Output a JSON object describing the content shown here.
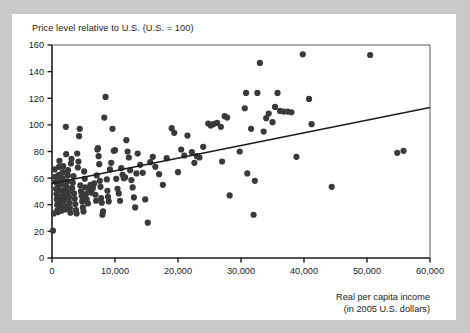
{
  "page": {
    "background_color": "#c9c9c9",
    "card_color": "#ffffff",
    "top_fragment": ""
  },
  "chart_data": {
    "type": "scatter",
    "title": "Price level relative to U.S. (U.S. = 100)",
    "xlabel_line1": "Real per capita income",
    "xlabel_line2": "(in 2005 U.S. dollars)",
    "ylabel": "Price level relative to U.S. (U.S. = 100)",
    "xlim": [
      0,
      60000
    ],
    "ylim": [
      0,
      160
    ],
    "xticks": [
      0,
      10000,
      20000,
      30000,
      40000,
      50000,
      60000
    ],
    "xtick_labels": [
      "0",
      "10,000",
      "20,000",
      "30,000",
      "40,000",
      "50,000",
      "60,000"
    ],
    "yticks": [
      0,
      20,
      40,
      60,
      80,
      100,
      120,
      140,
      160
    ],
    "ytick_labels": [
      "0",
      "20",
      "40",
      "60",
      "80",
      "100",
      "120",
      "140",
      "160"
    ],
    "grid": false,
    "legend": null,
    "marker_color": "#3a3a3a",
    "marker_size": 3.1,
    "trendline": {
      "type": "line",
      "color": "#1b1b1b",
      "x": [
        0,
        60000
      ],
      "y": [
        56,
        113
      ]
    },
    "points": [
      [
        150,
        20.5
      ],
      [
        300,
        33.5
      ],
      [
        420,
        66.5
      ],
      [
        520,
        61.0
      ],
      [
        600,
        57.0
      ],
      [
        650,
        52.0
      ],
      [
        700,
        48.0
      ],
      [
        760,
        44.0
      ],
      [
        820,
        40.0
      ],
      [
        880,
        36.0
      ],
      [
        930,
        34.5
      ],
      [
        980,
        54.0
      ],
      [
        1020,
        58.5
      ],
      [
        1080,
        62.5
      ],
      [
        1120,
        68.5
      ],
      [
        1180,
        73.0
      ],
      [
        1250,
        50.5
      ],
      [
        1300,
        46.0
      ],
      [
        1360,
        42.0
      ],
      [
        1420,
        38.5
      ],
      [
        1500,
        35.5
      ],
      [
        1560,
        55.5
      ],
      [
        1620,
        60.0
      ],
      [
        1700,
        64.5
      ],
      [
        1780,
        69.0
      ],
      [
        1850,
        51.0
      ],
      [
        1900,
        47.0
      ],
      [
        1980,
        43.5
      ],
      [
        2050,
        39.0
      ],
      [
        2120,
        36.5
      ],
      [
        2200,
        98.5
      ],
      [
        2250,
        78.0
      ],
      [
        2320,
        53.5
      ],
      [
        2400,
        57.5
      ],
      [
        2480,
        62.0
      ],
      [
        2550,
        66.0
      ],
      [
        2620,
        49.5
      ],
      [
        2700,
        45.5
      ],
      [
        2780,
        41.5
      ],
      [
        2850,
        37.5
      ],
      [
        2920,
        34.0
      ],
      [
        3000,
        71.0
      ],
      [
        3100,
        74.5
      ],
      [
        3200,
        52.5
      ],
      [
        3300,
        56.5
      ],
      [
        3400,
        61.5
      ],
      [
        3500,
        48.5
      ],
      [
        3600,
        44.5
      ],
      [
        3700,
        40.5
      ],
      [
        3800,
        36.0
      ],
      [
        3900,
        33.5
      ],
      [
        4000,
        78.5
      ],
      [
        4100,
        68.0
      ],
      [
        4200,
        72.5
      ],
      [
        4300,
        91.5
      ],
      [
        4400,
        97.0
      ],
      [
        4500,
        54.5
      ],
      [
        4600,
        50.0
      ],
      [
        4700,
        46.5
      ],
      [
        4800,
        42.5
      ],
      [
        4900,
        38.0
      ],
      [
        5000,
        35.0
      ],
      [
        5100,
        65.0
      ],
      [
        5200,
        59.5
      ],
      [
        5300,
        53.0
      ],
      [
        5400,
        48.0
      ],
      [
        5500,
        44.0
      ],
      [
        5700,
        41.0
      ],
      [
        5900,
        51.5
      ],
      [
        6100,
        55.0
      ],
      [
        6300,
        49.0
      ],
      [
        6500,
        52.5
      ],
      [
        6700,
        56.0
      ],
      [
        6900,
        47.5
      ],
      [
        7000,
        43.0
      ],
      [
        7100,
        62.0
      ],
      [
        7200,
        81.5
      ],
      [
        7300,
        82.5
      ],
      [
        7400,
        76.5
      ],
      [
        7500,
        70.5
      ],
      [
        7600,
        58.0
      ],
      [
        7700,
        53.5
      ],
      [
        7800,
        45.0
      ],
      [
        7900,
        41.5
      ],
      [
        8000,
        32.5
      ],
      [
        8100,
        35.0
      ],
      [
        8300,
        105.5
      ],
      [
        8500,
        121.0
      ],
      [
        8700,
        59.0
      ],
      [
        8800,
        50.5
      ],
      [
        8900,
        46.0
      ],
      [
        9000,
        42.5
      ],
      [
        9200,
        66.5
      ],
      [
        9400,
        71.5
      ],
      [
        9600,
        97.0
      ],
      [
        9800,
        80.5
      ],
      [
        10000,
        81.0
      ],
      [
        10200,
        59.5
      ],
      [
        10400,
        52.0
      ],
      [
        10600,
        48.5
      ],
      [
        10800,
        43.0
      ],
      [
        11000,
        67.5
      ],
      [
        11200,
        62.5
      ],
      [
        11400,
        60.0
      ],
      [
        11600,
        60.5
      ],
      [
        11800,
        88.5
      ],
      [
        12000,
        80.0
      ],
      [
        12200,
        75.5
      ],
      [
        12400,
        66.0
      ],
      [
        12600,
        58.5
      ],
      [
        12800,
        53.0
      ],
      [
        13000,
        45.5
      ],
      [
        13200,
        38.0
      ],
      [
        13400,
        63.5
      ],
      [
        13600,
        78.5
      ],
      [
        14000,
        70.0
      ],
      [
        14400,
        64.0
      ],
      [
        14800,
        44.0
      ],
      [
        15200,
        26.5
      ],
      [
        15600,
        72.0
      ],
      [
        16000,
        76.0
      ],
      [
        16400,
        68.5
      ],
      [
        17000,
        63.0
      ],
      [
        17600,
        55.0
      ],
      [
        18200,
        75.0
      ],
      [
        19000,
        97.5
      ],
      [
        19400,
        94.0
      ],
      [
        20000,
        64.5
      ],
      [
        20500,
        81.5
      ],
      [
        21000,
        77.0
      ],
      [
        21500,
        92.0
      ],
      [
        22200,
        79.5
      ],
      [
        22600,
        71.5
      ],
      [
        23000,
        76.5
      ],
      [
        23400,
        75.5
      ],
      [
        24000,
        83.5
      ],
      [
        24800,
        101.0
      ],
      [
        25200,
        99.5
      ],
      [
        25600,
        100.5
      ],
      [
        26200,
        101.5
      ],
      [
        26800,
        98.5
      ],
      [
        27000,
        72.5
      ],
      [
        27400,
        106.5
      ],
      [
        27800,
        105.5
      ],
      [
        28200,
        47.0
      ],
      [
        29800,
        80.0
      ],
      [
        30600,
        112.5
      ],
      [
        30800,
        124.0
      ],
      [
        31000,
        63.5
      ],
      [
        31600,
        97.0
      ],
      [
        32000,
        32.5
      ],
      [
        32200,
        58.0
      ],
      [
        32600,
        124.0
      ],
      [
        33000,
        146.5
      ],
      [
        33600,
        95.0
      ],
      [
        34000,
        105.0
      ],
      [
        34400,
        108.5
      ],
      [
        35000,
        102.0
      ],
      [
        35400,
        113.5
      ],
      [
        35800,
        124.0
      ],
      [
        36200,
        110.5
      ],
      [
        36800,
        110.0
      ],
      [
        37400,
        110.0
      ],
      [
        38000,
        109.5
      ],
      [
        38800,
        76.0
      ],
      [
        39800,
        153.0
      ],
      [
        40800,
        119.5
      ],
      [
        41200,
        100.5
      ],
      [
        44400,
        53.5
      ],
      [
        50500,
        152.5
      ],
      [
        54800,
        79.0
      ],
      [
        55800,
        80.5
      ]
    ]
  }
}
